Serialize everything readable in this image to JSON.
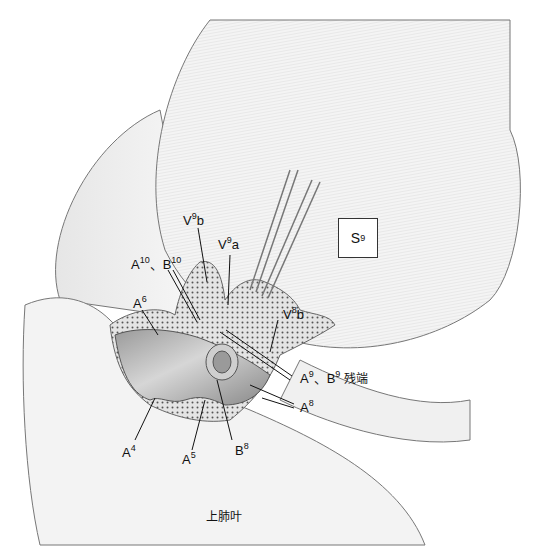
{
  "figure": {
    "type": "anatomical-illustration",
    "segment_box": {
      "base": "S",
      "sup": "9"
    },
    "lobe_label": "上肺叶",
    "labels": [
      {
        "id": "v9b",
        "base": "V",
        "sup": "9",
        "suffix": "b"
      },
      {
        "id": "v9a",
        "base": "V",
        "sup": "9",
        "suffix": "a"
      },
      {
        "id": "a10b10",
        "base": "A",
        "sup": "10",
        "suffix": "、B",
        "sup2": "10"
      },
      {
        "id": "a6",
        "base": "A",
        "sup": "6",
        "suffix": ""
      },
      {
        "id": "v8b",
        "base": "V",
        "sup": "8",
        "suffix": "b"
      },
      {
        "id": "a9b9",
        "base": "A",
        "sup": "9",
        "suffix": "、B",
        "sup2": "9",
        "tail": " 残端"
      },
      {
        "id": "a8",
        "base": "A",
        "sup": "8",
        "suffix": ""
      },
      {
        "id": "a4",
        "base": "A",
        "sup": "4",
        "suffix": ""
      },
      {
        "id": "a5",
        "base": "A",
        "sup": "5",
        "suffix": ""
      },
      {
        "id": "b8",
        "base": "B",
        "sup": "8",
        "suffix": ""
      }
    ],
    "colors": {
      "vessel_fill": "#8e8e8e",
      "tissue_fill": "#d8d8d8",
      "lobe_fill": "#f2f2f2",
      "outline": "#666666"
    }
  }
}
